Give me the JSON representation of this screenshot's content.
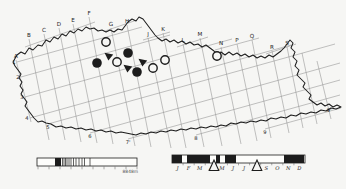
{
  "figure": {
    "background": "#f6f6f4",
    "ink": "#1c1c1c",
    "grid_color": "#909090"
  },
  "map": {
    "outline": [
      [
        13,
        62
      ],
      [
        17,
        55
      ],
      [
        21,
        52
      ],
      [
        25,
        54
      ],
      [
        29,
        48
      ],
      [
        33,
        50
      ],
      [
        38,
        45
      ],
      [
        42,
        46
      ],
      [
        46,
        40
      ],
      [
        50,
        42
      ],
      [
        54,
        37
      ],
      [
        58,
        39
      ],
      [
        62,
        34
      ],
      [
        66,
        36
      ],
      [
        70,
        31
      ],
      [
        74,
        33
      ],
      [
        78,
        29
      ],
      [
        82,
        31
      ],
      [
        86,
        27
      ],
      [
        90,
        29
      ],
      [
        94,
        28
      ],
      [
        98,
        31
      ],
      [
        102,
        30
      ],
      [
        106,
        32
      ],
      [
        110,
        30
      ],
      [
        114,
        32
      ],
      [
        118,
        29
      ],
      [
        122,
        30
      ],
      [
        125,
        26
      ],
      [
        128,
        22
      ],
      [
        132,
        19
      ],
      [
        136,
        21
      ],
      [
        139,
        17
      ],
      [
        143,
        19
      ],
      [
        146,
        23
      ],
      [
        149,
        27
      ],
      [
        152,
        31
      ],
      [
        155,
        35
      ],
      [
        158,
        38
      ],
      [
        162,
        41
      ],
      [
        166,
        39
      ],
      [
        170,
        42
      ],
      [
        174,
        40
      ],
      [
        178,
        43
      ],
      [
        182,
        41
      ],
      [
        186,
        44
      ],
      [
        190,
        42
      ],
      [
        194,
        45
      ],
      [
        198,
        44
      ],
      [
        202,
        47
      ],
      [
        206,
        45
      ],
      [
        210,
        48
      ],
      [
        214,
        51
      ],
      [
        217,
        55
      ],
      [
        221,
        52
      ],
      [
        225,
        55
      ],
      [
        229,
        52
      ],
      [
        233,
        55
      ],
      [
        237,
        53
      ],
      [
        241,
        56
      ],
      [
        245,
        54
      ],
      [
        249,
        57
      ],
      [
        253,
        55
      ],
      [
        257,
        58
      ],
      [
        261,
        56
      ],
      [
        265,
        58
      ],
      [
        269,
        55
      ],
      [
        273,
        57
      ],
      [
        277,
        54
      ],
      [
        281,
        51
      ],
      [
        284,
        48
      ],
      [
        287,
        44
      ],
      [
        290,
        40
      ],
      [
        293,
        43
      ],
      [
        291,
        48
      ],
      [
        295,
        52
      ],
      [
        293,
        57
      ],
      [
        297,
        61
      ],
      [
        295,
        66
      ],
      [
        299,
        70
      ],
      [
        297,
        75
      ],
      [
        301,
        79
      ],
      [
        305,
        83
      ],
      [
        303,
        87
      ],
      [
        307,
        91
      ],
      [
        311,
        95
      ],
      [
        309,
        99
      ],
      [
        313,
        102
      ],
      [
        317,
        105
      ],
      [
        321,
        103
      ],
      [
        325,
        106
      ],
      [
        329,
        104
      ],
      [
        333,
        107
      ],
      [
        337,
        105
      ],
      [
        341,
        107
      ],
      [
        336,
        109
      ],
      [
        331,
        108
      ],
      [
        326,
        111
      ],
      [
        321,
        110
      ],
      [
        316,
        113
      ],
      [
        311,
        112
      ],
      [
        306,
        114
      ],
      [
        301,
        113
      ],
      [
        296,
        116
      ],
      [
        291,
        115
      ],
      [
        286,
        118
      ],
      [
        281,
        117
      ],
      [
        276,
        119
      ],
      [
        271,
        118
      ],
      [
        266,
        121
      ],
      [
        261,
        120
      ],
      [
        256,
        122
      ],
      [
        251,
        121
      ],
      [
        246,
        123
      ],
      [
        241,
        122
      ],
      [
        236,
        124
      ],
      [
        231,
        123
      ],
      [
        226,
        126
      ],
      [
        221,
        125
      ],
      [
        216,
        127
      ],
      [
        211,
        126
      ],
      [
        206,
        128
      ],
      [
        201,
        127
      ],
      [
        196,
        129
      ],
      [
        191,
        128
      ],
      [
        186,
        130
      ],
      [
        181,
        129
      ],
      [
        176,
        131
      ],
      [
        171,
        130
      ],
      [
        166,
        132
      ],
      [
        161,
        131
      ],
      [
        156,
        133
      ],
      [
        151,
        132
      ],
      [
        146,
        134
      ],
      [
        141,
        133
      ],
      [
        136,
        135
      ],
      [
        131,
        134
      ],
      [
        126,
        133
      ],
      [
        121,
        132
      ],
      [
        116,
        133
      ],
      [
        111,
        131
      ],
      [
        106,
        132
      ],
      [
        101,
        130
      ],
      [
        96,
        131
      ],
      [
        91,
        129
      ],
      [
        86,
        130
      ],
      [
        81,
        128
      ],
      [
        76,
        129
      ],
      [
        71,
        127
      ],
      [
        66,
        128
      ],
      [
        61,
        126
      ],
      [
        56,
        127
      ],
      [
        51,
        124
      ],
      [
        46,
        123
      ],
      [
        42,
        121
      ],
      [
        38,
        122
      ],
      [
        34,
        118
      ],
      [
        31,
        114
      ],
      [
        28,
        110
      ],
      [
        25,
        106
      ],
      [
        27,
        102
      ],
      [
        24,
        98
      ],
      [
        21,
        94
      ],
      [
        23,
        90
      ],
      [
        20,
        86
      ],
      [
        22,
        82
      ],
      [
        19,
        78
      ],
      [
        21,
        74
      ],
      [
        18,
        70
      ],
      [
        15,
        66
      ]
    ],
    "column_lines": [
      [
        16,
        60,
        31,
        122
      ],
      [
        29,
        39,
        49,
        140
      ],
      [
        44,
        34,
        65,
        140
      ],
      [
        59,
        28,
        81,
        142
      ],
      [
        73,
        24,
        97,
        143
      ],
      [
        89,
        17,
        113,
        144
      ],
      [
        111,
        28,
        135,
        146
      ],
      [
        127,
        25,
        151,
        147
      ],
      [
        148,
        38,
        171,
        148
      ],
      [
        163,
        33,
        186,
        148
      ],
      [
        183,
        44,
        204,
        147
      ],
      [
        200,
        38,
        222,
        146
      ],
      [
        221,
        47,
        241,
        144
      ],
      [
        237,
        44,
        257,
        141
      ],
      [
        252,
        40,
        271,
        138
      ],
      [
        272,
        51,
        289,
        133
      ],
      [
        287,
        47,
        303,
        128
      ],
      [
        302,
        53,
        317,
        124
      ],
      [
        317,
        61,
        331,
        119
      ]
    ],
    "row_lines": [
      [
        17,
        62,
        142,
        27
      ],
      [
        21,
        77,
        170,
        35
      ],
      [
        25,
        97,
        232,
        39
      ],
      [
        30,
        118,
        291,
        45
      ],
      [
        48,
        124,
        335,
        44
      ],
      [
        90,
        133,
        340,
        63
      ],
      [
        128,
        139,
        340,
        80
      ],
      [
        196,
        135,
        340,
        95
      ],
      [
        265,
        129,
        341,
        108
      ]
    ],
    "staircase_lines": [
      [
        25,
        47,
        95,
        22
      ],
      [
        105,
        31,
        137,
        20
      ],
      [
        143,
        40,
        170,
        32
      ],
      [
        177,
        47,
        208,
        37
      ],
      [
        215,
        50,
        259,
        38
      ],
      [
        266,
        54,
        296,
        44
      ]
    ],
    "column_labels": [
      {
        "t": "A",
        "x": 16,
        "y": 58
      },
      {
        "t": "B",
        "x": 29,
        "y": 37
      },
      {
        "t": "C",
        "x": 44,
        "y": 32
      },
      {
        "t": "D",
        "x": 59,
        "y": 26
      },
      {
        "t": "E",
        "x": 73,
        "y": 22
      },
      {
        "t": "F",
        "x": 89,
        "y": 15
      },
      {
        "t": "G",
        "x": 111,
        "y": 26
      },
      {
        "t": "H",
        "x": 127,
        "y": 23
      },
      {
        "t": "J",
        "x": 148,
        "y": 36
      },
      {
        "t": "K",
        "x": 163,
        "y": 31
      },
      {
        "t": "L",
        "x": 183,
        "y": 42
      },
      {
        "t": "M",
        "x": 200,
        "y": 36
      },
      {
        "t": "N",
        "x": 221,
        "y": 45
      },
      {
        "t": "P",
        "x": 237,
        "y": 42
      },
      {
        "t": "Q",
        "x": 252,
        "y": 38
      },
      {
        "t": "R",
        "x": 272,
        "y": 49
      },
      {
        "t": "S",
        "x": 287,
        "y": 45
      }
    ],
    "row_labels": [
      {
        "t": "1",
        "x": 14,
        "y": 64
      },
      {
        "t": "2",
        "x": 18,
        "y": 79
      },
      {
        "t": "3",
        "x": 22,
        "y": 99
      },
      {
        "t": "4",
        "x": 27,
        "y": 120
      },
      {
        "t": "5",
        "x": 48,
        "y": 129
      },
      {
        "t": "6",
        "x": 90,
        "y": 138
      },
      {
        "t": "7'",
        "x": 128,
        "y": 144
      },
      {
        "t": "8",
        "x": 196,
        "y": 140
      },
      {
        "t": "9",
        "x": 265,
        "y": 134
      },
      {
        "t": "9'",
        "x": 329,
        "y": 112
      }
    ]
  },
  "symbols": {
    "open_circles": [
      [
        106,
        42
      ],
      [
        117,
        62
      ],
      [
        153,
        68
      ],
      [
        165,
        60
      ],
      [
        217,
        56
      ]
    ],
    "filled_circles": [
      [
        97,
        63
      ],
      [
        128,
        53
      ],
      [
        137,
        72
      ]
    ],
    "filled_triangles": [
      [
        109,
        56
      ],
      [
        143,
        62
      ],
      [
        128,
        68
      ]
    ]
  },
  "elevation_scale": {
    "x": 37,
    "y": 158,
    "width": 100,
    "height": 8,
    "solid_block": [
      55,
      61
    ],
    "hatch_lines": [
      62.5,
      64,
      65.5,
      67,
      69,
      71,
      73.5,
      76,
      79,
      82,
      84.5,
      90
    ],
    "tick_xs": [
      38,
      49,
      60,
      71,
      82,
      93,
      104,
      115,
      126,
      137
    ],
    "max_label": "8848m"
  },
  "phenology_scale": {
    "x": 172,
    "y": 155,
    "width": 133,
    "height": 8,
    "months": [
      "J",
      "F",
      "M",
      "A",
      "M",
      "J",
      "J",
      "A",
      "S",
      "O",
      "N",
      "D"
    ],
    "filled_segments": [
      [
        172,
        182
      ],
      [
        187,
        210
      ],
      [
        216,
        220
      ],
      [
        225,
        236
      ],
      [
        284,
        304
      ]
    ],
    "open_triangles": [
      214,
      257
    ]
  }
}
